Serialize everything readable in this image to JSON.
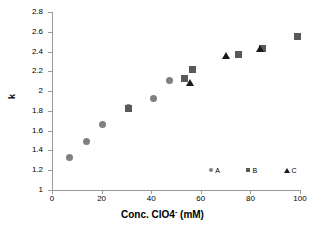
{
  "chart_data": {
    "type": "scatter",
    "title": "",
    "xlabel": "Conc. ClO4⁻ (mM)",
    "xlabel_base": "Conc. ClO4",
    "xlabel_sup": "-",
    "xlabel_unit": " (mM)",
    "ylabel": "k",
    "xlim": [
      0,
      100
    ],
    "ylim": [
      1,
      2.8
    ],
    "xticks": [
      0,
      20,
      40,
      60,
      80,
      100
    ],
    "xtick_labels": [
      "0",
      "20",
      "40",
      "60",
      "80",
      "100"
    ],
    "yticks": [
      1,
      1.2,
      1.4,
      1.6,
      1.8,
      2,
      2.2,
      2.4,
      2.6,
      2.8
    ],
    "ytick_labels": [
      "1",
      "1.2",
      "1.4",
      "1.6",
      "1.8",
      "2",
      "2.2",
      "2.4",
      "2.6",
      "2.8"
    ],
    "grid": false,
    "legend_position": "inside-bottom-right",
    "axis_color": "#9a9a9a",
    "series": [
      {
        "name": "A",
        "marker": "circle",
        "color": "#808080",
        "points": [
          {
            "x": 7.0,
            "y": 1.33
          },
          {
            "x": 14.0,
            "y": 1.49
          },
          {
            "x": 20.5,
            "y": 1.66
          },
          {
            "x": 31.0,
            "y": 1.83
          },
          {
            "x": 41.0,
            "y": 1.93
          },
          {
            "x": 47.5,
            "y": 2.11
          },
          {
            "x": 53.5,
            "y": 2.13
          }
        ]
      },
      {
        "name": "B",
        "marker": "square",
        "color": "#595959",
        "points": [
          {
            "x": 31.0,
            "y": 1.82
          },
          {
            "x": 53.5,
            "y": 2.13
          },
          {
            "x": 56.5,
            "y": 2.22
          },
          {
            "x": 75.0,
            "y": 2.37
          },
          {
            "x": 85.0,
            "y": 2.43
          },
          {
            "x": 99.0,
            "y": 2.55
          }
        ]
      },
      {
        "name": "C",
        "marker": "triangle",
        "color": "#1a1a1a",
        "points": [
          {
            "x": 55.5,
            "y": 2.09
          },
          {
            "x": 70.0,
            "y": 2.36
          },
          {
            "x": 84.0,
            "y": 2.43
          }
        ]
      }
    ],
    "legend_entries": [
      {
        "label": "A",
        "marker": "circle",
        "color": "#808080",
        "x": 65,
        "y": 1.2
      },
      {
        "label": "B",
        "marker": "square",
        "color": "#595959",
        "x": 80,
        "y": 1.2
      },
      {
        "label": "C",
        "marker": "triangle",
        "color": "#1a1a1a",
        "x": 95,
        "y": 1.2
      }
    ]
  }
}
